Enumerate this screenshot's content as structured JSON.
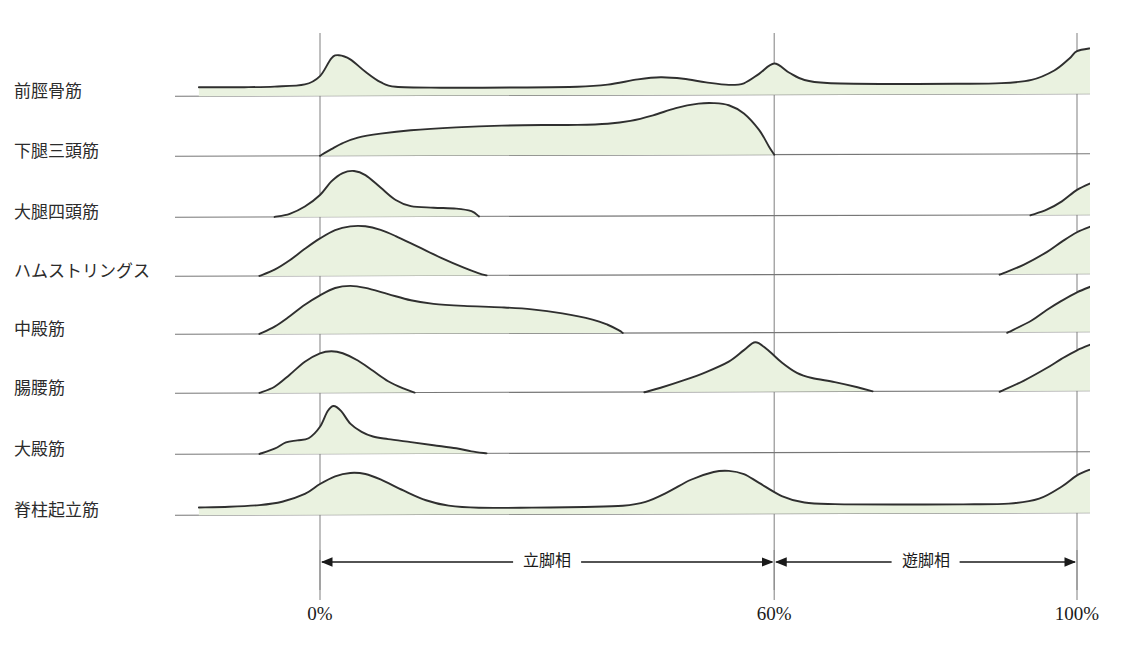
{
  "figure": {
    "title": "",
    "caption": "",
    "background_color": "#ffffff",
    "fill_color": "#eaf2e0",
    "stroke_color": "#2f2f2f",
    "gridline_color": "#8a8a8a",
    "baseline_color": "#777777"
  },
  "axis": {
    "ticks": [
      {
        "label": "0%",
        "value": 0
      },
      {
        "label": "60%",
        "value": 60
      },
      {
        "label": "100%",
        "value": 100
      }
    ],
    "x_min": 0,
    "x_max": 100,
    "unit": "%"
  },
  "phases": [
    {
      "label": "立脚相",
      "from": 0,
      "to": 60
    },
    {
      "label": "遊脚相",
      "from": 60,
      "to": 100
    }
  ],
  "chart_data": {
    "type": "area",
    "title": "",
    "subtitle": "",
    "xlabel": "",
    "ylabel": "",
    "xlim": [
      0,
      100
    ],
    "grid": true,
    "legend_position": "none",
    "x_tick_labels": [
      "0%",
      "60%",
      "100%"
    ],
    "x_tick_values": [
      0,
      60,
      100
    ],
    "annotations": [
      "立脚相",
      "遊脚相"
    ],
    "series": [
      {
        "name": "前脛骨筋",
        "row": 0,
        "x_start": -16,
        "x_end": 102,
        "values": [
          {
            "x": -16,
            "y": 0.17
          },
          {
            "x": -10,
            "y": 0.17
          },
          {
            "x": -6,
            "y": 0.18
          },
          {
            "x": -2,
            "y": 0.22
          },
          {
            "x": 0,
            "y": 0.38
          },
          {
            "x": 1.5,
            "y": 0.72
          },
          {
            "x": 2.5,
            "y": 0.78
          },
          {
            "x": 4,
            "y": 0.7
          },
          {
            "x": 6,
            "y": 0.46
          },
          {
            "x": 8,
            "y": 0.26
          },
          {
            "x": 10,
            "y": 0.17
          },
          {
            "x": 16,
            "y": 0.15
          },
          {
            "x": 26,
            "y": 0.15
          },
          {
            "x": 34,
            "y": 0.16
          },
          {
            "x": 38,
            "y": 0.2
          },
          {
            "x": 42,
            "y": 0.3
          },
          {
            "x": 45,
            "y": 0.34
          },
          {
            "x": 48,
            "y": 0.31
          },
          {
            "x": 51,
            "y": 0.24
          },
          {
            "x": 54,
            "y": 0.19
          },
          {
            "x": 56,
            "y": 0.22
          },
          {
            "x": 58,
            "y": 0.4
          },
          {
            "x": 60,
            "y": 0.6
          },
          {
            "x": 62,
            "y": 0.42
          },
          {
            "x": 64,
            "y": 0.28
          },
          {
            "x": 67,
            "y": 0.22
          },
          {
            "x": 74,
            "y": 0.2
          },
          {
            "x": 84,
            "y": 0.2
          },
          {
            "x": 90,
            "y": 0.21
          },
          {
            "x": 94,
            "y": 0.27
          },
          {
            "x": 97,
            "y": 0.45
          },
          {
            "x": 99,
            "y": 0.68
          },
          {
            "x": 100,
            "y": 0.82
          },
          {
            "x": 102,
            "y": 0.88
          }
        ]
      },
      {
        "name": "下腿三頭筋",
        "row": 1,
        "x_start": 0,
        "x_end": 60,
        "values": [
          {
            "x": 0,
            "y": 0.0
          },
          {
            "x": 1.5,
            "y": 0.12
          },
          {
            "x": 3,
            "y": 0.23
          },
          {
            "x": 5,
            "y": 0.33
          },
          {
            "x": 8,
            "y": 0.4
          },
          {
            "x": 12,
            "y": 0.46
          },
          {
            "x": 18,
            "y": 0.51
          },
          {
            "x": 24,
            "y": 0.54
          },
          {
            "x": 30,
            "y": 0.55
          },
          {
            "x": 34,
            "y": 0.55
          },
          {
            "x": 38,
            "y": 0.57
          },
          {
            "x": 41,
            "y": 0.62
          },
          {
            "x": 44,
            "y": 0.72
          },
          {
            "x": 47,
            "y": 0.85
          },
          {
            "x": 50,
            "y": 0.93
          },
          {
            "x": 52,
            "y": 0.94
          },
          {
            "x": 54,
            "y": 0.9
          },
          {
            "x": 56,
            "y": 0.75
          },
          {
            "x": 58,
            "y": 0.45
          },
          {
            "x": 59.3,
            "y": 0.15
          },
          {
            "x": 60,
            "y": 0.0
          }
        ]
      },
      {
        "name": "大腿四頭筋",
        "row": 2,
        "x_start": -6,
        "x_end": 102,
        "values": [
          {
            "x": -6,
            "y": 0.0
          },
          {
            "x": -4,
            "y": 0.06
          },
          {
            "x": -2,
            "y": 0.2
          },
          {
            "x": 0,
            "y": 0.42
          },
          {
            "x": 1.5,
            "y": 0.68
          },
          {
            "x": 3,
            "y": 0.84
          },
          {
            "x": 4.5,
            "y": 0.88
          },
          {
            "x": 6,
            "y": 0.8
          },
          {
            "x": 8,
            "y": 0.56
          },
          {
            "x": 10,
            "y": 0.32
          },
          {
            "x": 12,
            "y": 0.2
          },
          {
            "x": 15,
            "y": 0.17
          },
          {
            "x": 18,
            "y": 0.15
          },
          {
            "x": 20,
            "y": 0.1
          },
          {
            "x": 21,
            "y": 0.0
          },
          {
            "x": 94,
            "y": 0.0
          },
          {
            "x": 96,
            "y": 0.1
          },
          {
            "x": 98,
            "y": 0.26
          },
          {
            "x": 100,
            "y": 0.48
          },
          {
            "x": 102,
            "y": 0.62
          }
        ]
      },
      {
        "name": "ハムストリングス",
        "row": 3,
        "x_start": -8,
        "x_end": 102,
        "values": [
          {
            "x": -8,
            "y": 0.0
          },
          {
            "x": -6,
            "y": 0.12
          },
          {
            "x": -4,
            "y": 0.3
          },
          {
            "x": -2,
            "y": 0.52
          },
          {
            "x": 0,
            "y": 0.72
          },
          {
            "x": 2,
            "y": 0.88
          },
          {
            "x": 4,
            "y": 0.95
          },
          {
            "x": 6,
            "y": 0.95
          },
          {
            "x": 8,
            "y": 0.88
          },
          {
            "x": 10,
            "y": 0.76
          },
          {
            "x": 13,
            "y": 0.55
          },
          {
            "x": 16,
            "y": 0.34
          },
          {
            "x": 19,
            "y": 0.15
          },
          {
            "x": 21,
            "y": 0.04
          },
          {
            "x": 22,
            "y": 0.0
          },
          {
            "x": 90,
            "y": 0.0
          },
          {
            "x": 93,
            "y": 0.18
          },
          {
            "x": 96,
            "y": 0.42
          },
          {
            "x": 98,
            "y": 0.62
          },
          {
            "x": 100,
            "y": 0.8
          },
          {
            "x": 102,
            "y": 0.92
          }
        ]
      },
      {
        "name": "中殿筋",
        "row": 4,
        "x_start": -8,
        "x_end": 102,
        "values": [
          {
            "x": -8,
            "y": 0.0
          },
          {
            "x": -6,
            "y": 0.14
          },
          {
            "x": -4,
            "y": 0.34
          },
          {
            "x": -2,
            "y": 0.56
          },
          {
            "x": 0,
            "y": 0.74
          },
          {
            "x": 2,
            "y": 0.88
          },
          {
            "x": 4,
            "y": 0.92
          },
          {
            "x": 6,
            "y": 0.88
          },
          {
            "x": 9,
            "y": 0.76
          },
          {
            "x": 12,
            "y": 0.64
          },
          {
            "x": 15,
            "y": 0.57
          },
          {
            "x": 19,
            "y": 0.53
          },
          {
            "x": 24,
            "y": 0.5
          },
          {
            "x": 28,
            "y": 0.46
          },
          {
            "x": 32,
            "y": 0.38
          },
          {
            "x": 36,
            "y": 0.26
          },
          {
            "x": 38,
            "y": 0.16
          },
          {
            "x": 39.5,
            "y": 0.05
          },
          {
            "x": 40,
            "y": 0.0
          },
          {
            "x": 91,
            "y": 0.0
          },
          {
            "x": 94,
            "y": 0.22
          },
          {
            "x": 96,
            "y": 0.42
          },
          {
            "x": 98,
            "y": 0.6
          },
          {
            "x": 100,
            "y": 0.76
          },
          {
            "x": 102,
            "y": 0.88
          }
        ]
      },
      {
        "name": "腸腰筋",
        "row": 5,
        "x_start": -8,
        "x_end": 102,
        "values": [
          {
            "x": -8,
            "y": 0.0
          },
          {
            "x": -6,
            "y": 0.12
          },
          {
            "x": -4,
            "y": 0.35
          },
          {
            "x": -2,
            "y": 0.6
          },
          {
            "x": 0,
            "y": 0.76
          },
          {
            "x": 1.5,
            "y": 0.8
          },
          {
            "x": 3,
            "y": 0.76
          },
          {
            "x": 5,
            "y": 0.62
          },
          {
            "x": 7,
            "y": 0.42
          },
          {
            "x": 9,
            "y": 0.22
          },
          {
            "x": 11,
            "y": 0.08
          },
          {
            "x": 12.5,
            "y": 0.0
          },
          {
            "x": 43,
            "y": 0.0
          },
          {
            "x": 45,
            "y": 0.08
          },
          {
            "x": 48,
            "y": 0.22
          },
          {
            "x": 51,
            "y": 0.38
          },
          {
            "x": 54,
            "y": 0.58
          },
          {
            "x": 56,
            "y": 0.8
          },
          {
            "x": 57.5,
            "y": 0.95
          },
          {
            "x": 59,
            "y": 0.82
          },
          {
            "x": 61,
            "y": 0.56
          },
          {
            "x": 63,
            "y": 0.36
          },
          {
            "x": 65,
            "y": 0.26
          },
          {
            "x": 68,
            "y": 0.18
          },
          {
            "x": 71,
            "y": 0.08
          },
          {
            "x": 73,
            "y": 0.0
          },
          {
            "x": 90,
            "y": 0.0
          },
          {
            "x": 93,
            "y": 0.2
          },
          {
            "x": 96,
            "y": 0.44
          },
          {
            "x": 98,
            "y": 0.62
          },
          {
            "x": 100,
            "y": 0.78
          },
          {
            "x": 102,
            "y": 0.9
          }
        ]
      },
      {
        "name": "大殿筋",
        "row": 6,
        "x_start": -8,
        "x_end": 22,
        "values": [
          {
            "x": -8,
            "y": 0.0
          },
          {
            "x": -6,
            "y": 0.1
          },
          {
            "x": -4.5,
            "y": 0.22
          },
          {
            "x": -3,
            "y": 0.26
          },
          {
            "x": -1.5,
            "y": 0.3
          },
          {
            "x": 0,
            "y": 0.52
          },
          {
            "x": 1,
            "y": 0.82
          },
          {
            "x": 1.8,
            "y": 0.92
          },
          {
            "x": 2.8,
            "y": 0.82
          },
          {
            "x": 4,
            "y": 0.58
          },
          {
            "x": 5.5,
            "y": 0.42
          },
          {
            "x": 7,
            "y": 0.33
          },
          {
            "x": 9,
            "y": 0.28
          },
          {
            "x": 12,
            "y": 0.22
          },
          {
            "x": 15,
            "y": 0.16
          },
          {
            "x": 18,
            "y": 0.1
          },
          {
            "x": 20,
            "y": 0.04
          },
          {
            "x": 22,
            "y": 0.0
          }
        ]
      },
      {
        "name": "脊柱起立筋",
        "row": 7,
        "x_start": -16,
        "x_end": 102,
        "values": [
          {
            "x": -16,
            "y": 0.14
          },
          {
            "x": -12,
            "y": 0.15
          },
          {
            "x": -8,
            "y": 0.18
          },
          {
            "x": -5,
            "y": 0.24
          },
          {
            "x": -2,
            "y": 0.38
          },
          {
            "x": 0,
            "y": 0.56
          },
          {
            "x": 2,
            "y": 0.7
          },
          {
            "x": 4,
            "y": 0.76
          },
          {
            "x": 6,
            "y": 0.74
          },
          {
            "x": 8,
            "y": 0.64
          },
          {
            "x": 11,
            "y": 0.44
          },
          {
            "x": 14,
            "y": 0.26
          },
          {
            "x": 17,
            "y": 0.16
          },
          {
            "x": 21,
            "y": 0.12
          },
          {
            "x": 28,
            "y": 0.12
          },
          {
            "x": 35,
            "y": 0.13
          },
          {
            "x": 40,
            "y": 0.15
          },
          {
            "x": 43,
            "y": 0.22
          },
          {
            "x": 46,
            "y": 0.4
          },
          {
            "x": 49,
            "y": 0.62
          },
          {
            "x": 52,
            "y": 0.76
          },
          {
            "x": 54,
            "y": 0.78
          },
          {
            "x": 56,
            "y": 0.72
          },
          {
            "x": 58,
            "y": 0.56
          },
          {
            "x": 61,
            "y": 0.32
          },
          {
            "x": 64,
            "y": 0.2
          },
          {
            "x": 68,
            "y": 0.17
          },
          {
            "x": 76,
            "y": 0.16
          },
          {
            "x": 85,
            "y": 0.16
          },
          {
            "x": 91,
            "y": 0.17
          },
          {
            "x": 95,
            "y": 0.26
          },
          {
            "x": 98,
            "y": 0.48
          },
          {
            "x": 100,
            "y": 0.68
          },
          {
            "x": 102,
            "y": 0.8
          }
        ]
      }
    ]
  }
}
